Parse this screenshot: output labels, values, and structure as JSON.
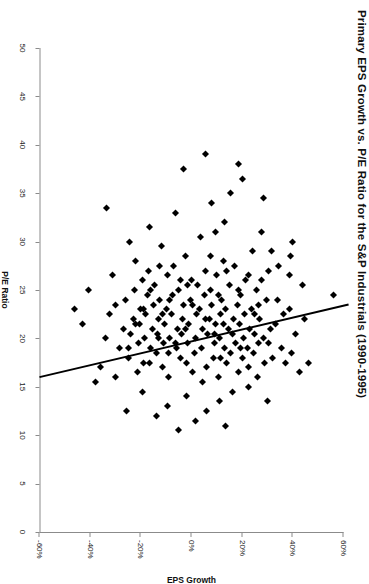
{
  "chart_data": {
    "type": "scatter",
    "title": "Primary EPS Growth vs. P/E Ratio for the S&P Industrials (1990-1995)",
    "orientation": "rotated-90-clockwise",
    "xlabel": "P/E Ratio",
    "ylabel": "EPS Growth",
    "xlim": [
      0,
      50
    ],
    "ylim": [
      -60,
      60
    ],
    "xticks": [
      0,
      5,
      10,
      15,
      20,
      25,
      30,
      35,
      40,
      45,
      50
    ],
    "xtick_labels": [
      "0",
      "5",
      "10",
      "15",
      "20",
      "25",
      "30",
      "35",
      "40",
      "45",
      "50"
    ],
    "yticks": [
      -60,
      -40,
      -20,
      0,
      20,
      40,
      60
    ],
    "ytick_labels": [
      "-60%",
      "-40%",
      "-20%",
      "0%",
      "20%",
      "40%",
      "60%"
    ],
    "grid": false,
    "legend": false,
    "marker": "diamond",
    "marker_color": "#000000",
    "axis_color": "#8b8b8b",
    "trendline": {
      "color": "#000000",
      "width": 2,
      "x_start": 16.0,
      "y_start": -60,
      "x_end": 23.5,
      "y_end": 62
    },
    "series": [
      {
        "name": "S&P Industrials",
        "points": [
          [
            24.5,
            56.0
          ],
          [
            17.5,
            46.0
          ],
          [
            16.5,
            42.5
          ],
          [
            30.0,
            40.0
          ],
          [
            28.5,
            39.0
          ],
          [
            26.5,
            38.5
          ],
          [
            22.5,
            36.5
          ],
          [
            19.0,
            35.5
          ],
          [
            21.5,
            33.0
          ],
          [
            18.0,
            32.0
          ],
          [
            27.0,
            30.5
          ],
          [
            24.0,
            29.5
          ],
          [
            17.5,
            29.0
          ],
          [
            34.5,
            28.5
          ],
          [
            31.0,
            27.5
          ],
          [
            22.0,
            27.0
          ],
          [
            19.5,
            26.5
          ],
          [
            16.0,
            26.0
          ],
          [
            25.0,
            25.5
          ],
          [
            20.5,
            25.0
          ],
          [
            18.5,
            24.5
          ],
          [
            29.0,
            24.0
          ],
          [
            23.0,
            23.5
          ],
          [
            21.0,
            23.0
          ],
          [
            17.0,
            22.5
          ],
          [
            19.0,
            22.0
          ],
          [
            26.0,
            21.5
          ],
          [
            22.5,
            21.0
          ],
          [
            20.0,
            20.5
          ],
          [
            18.0,
            20.0
          ],
          [
            24.5,
            19.5
          ],
          [
            21.5,
            19.0
          ],
          [
            16.5,
            18.5
          ],
          [
            23.5,
            18.0
          ],
          [
            19.5,
            17.5
          ],
          [
            27.5,
            17.0
          ],
          [
            22.0,
            16.5
          ],
          [
            20.5,
            16.0
          ],
          [
            18.5,
            15.5
          ],
          [
            25.5,
            15.0
          ],
          [
            21.0,
            14.5
          ],
          [
            17.5,
            14.0
          ],
          [
            23.0,
            13.5
          ],
          [
            19.0,
            13.0
          ],
          [
            28.0,
            12.5
          ],
          [
            24.0,
            12.0
          ],
          [
            22.5,
            11.5
          ],
          [
            20.0,
            11.0
          ],
          [
            16.0,
            10.5
          ],
          [
            26.5,
            10.0
          ],
          [
            21.5,
            9.5
          ],
          [
            19.5,
            9.0
          ],
          [
            18.0,
            8.5
          ],
          [
            23.5,
            8.0
          ],
          [
            25.0,
            7.5
          ],
          [
            22.0,
            7.0
          ],
          [
            20.5,
            6.5
          ],
          [
            17.0,
            6.0
          ],
          [
            27.0,
            5.5
          ],
          [
            24.5,
            5.0
          ],
          [
            21.0,
            4.5
          ],
          [
            19.0,
            4.0
          ],
          [
            30.5,
            3.5
          ],
          [
            23.0,
            3.0
          ],
          [
            25.5,
            2.5
          ],
          [
            22.5,
            2.0
          ],
          [
            20.0,
            1.5
          ],
          [
            18.5,
            1.0
          ],
          [
            16.5,
            0.5
          ],
          [
            26.0,
            0.0
          ],
          [
            24.0,
            -0.5
          ],
          [
            21.5,
            -1.0
          ],
          [
            19.5,
            -1.5
          ],
          [
            17.5,
            -2.0
          ],
          [
            28.5,
            -2.5
          ],
          [
            23.5,
            -3.0
          ],
          [
            22.0,
            -3.5
          ],
          [
            20.5,
            -4.0
          ],
          [
            18.0,
            -4.5
          ],
          [
            25.0,
            -5.0
          ],
          [
            21.0,
            -5.5
          ],
          [
            19.0,
            -6.0
          ],
          [
            33.0,
            -6.5
          ],
          [
            27.5,
            -7.0
          ],
          [
            24.5,
            -7.5
          ],
          [
            22.5,
            -8.0
          ],
          [
            20.0,
            -8.5
          ],
          [
            16.0,
            -9.0
          ],
          [
            26.5,
            -9.5
          ],
          [
            23.0,
            -10.0
          ],
          [
            21.5,
            -10.5
          ],
          [
            19.5,
            -11.0
          ],
          [
            17.0,
            -11.5
          ],
          [
            29.5,
            -12.0
          ],
          [
            24.0,
            -12.5
          ],
          [
            22.0,
            -13.0
          ],
          [
            20.5,
            -13.5
          ],
          [
            18.5,
            -14.0
          ],
          [
            25.5,
            -14.5
          ],
          [
            23.5,
            -15.0
          ],
          [
            21.0,
            -15.5
          ],
          [
            19.0,
            -16.0
          ],
          [
            31.5,
            -16.5
          ],
          [
            27.0,
            -17.0
          ],
          [
            24.5,
            -17.5
          ],
          [
            22.5,
            -18.0
          ],
          [
            20.0,
            -18.5
          ],
          [
            17.5,
            -19.0
          ],
          [
            26.0,
            -19.5
          ],
          [
            23.0,
            -20.0
          ],
          [
            21.5,
            -20.5
          ],
          [
            19.5,
            -21.0
          ],
          [
            16.5,
            -21.5
          ],
          [
            28.0,
            -22.0
          ],
          [
            25.0,
            -22.5
          ],
          [
            22.0,
            -23.0
          ],
          [
            20.5,
            -24.0
          ],
          [
            18.0,
            -25.0
          ],
          [
            24.0,
            -26.0
          ],
          [
            21.0,
            -27.0
          ],
          [
            19.0,
            -28.5
          ],
          [
            23.5,
            -30.0
          ],
          [
            26.5,
            -31.0
          ],
          [
            22.5,
            -32.5
          ],
          [
            20.0,
            -34.0
          ],
          [
            17.0,
            -36.0
          ],
          [
            15.5,
            -38.0
          ],
          [
            25.0,
            -40.5
          ],
          [
            21.5,
            -43.0
          ],
          [
            23.0,
            -46.0
          ],
          [
            33.5,
            -33.5
          ],
          [
            36.5,
            20.0
          ],
          [
            38.0,
            18.5
          ],
          [
            35.0,
            15.5
          ],
          [
            37.5,
            -3.0
          ],
          [
            34.0,
            8.0
          ],
          [
            32.0,
            13.0
          ],
          [
            39.0,
            5.5
          ],
          [
            30.0,
            -24.5
          ],
          [
            31.0,
            9.5
          ],
          [
            13.5,
            30.0
          ],
          [
            14.5,
            16.0
          ],
          [
            12.5,
            6.0
          ],
          [
            14.0,
            -2.0
          ],
          [
            13.0,
            -9.5
          ],
          [
            15.0,
            22.5
          ],
          [
            11.5,
            1.5
          ],
          [
            12.0,
            -14.0
          ],
          [
            10.5,
            -5.0
          ],
          [
            13.5,
            11.0
          ],
          [
            14.5,
            -19.5
          ],
          [
            15.5,
            4.5
          ],
          [
            11.0,
            13.5
          ],
          [
            12.5,
            -25.5
          ],
          [
            16.0,
            -30.0
          ],
          [
            29.0,
            31.5
          ],
          [
            27.5,
            34.5
          ],
          [
            25.5,
            44.0
          ],
          [
            20.5,
            41.0
          ],
          [
            18.5,
            39.5
          ],
          [
            23.5,
            26.5
          ],
          [
            21.0,
            31.0
          ],
          [
            28.5,
            7.5
          ],
          [
            26.0,
            27.5
          ],
          [
            24.0,
            34.0
          ],
          [
            22.0,
            44.5
          ],
          [
            19.5,
            30.5
          ],
          [
            17.5,
            37.0
          ],
          [
            20.0,
            28.5
          ],
          [
            23.0,
            38.5
          ],
          [
            26.5,
            22.5
          ],
          [
            25.0,
            18.5
          ],
          [
            22.5,
            25.0
          ],
          [
            21.5,
            12.5
          ],
          [
            19.0,
            19.5
          ],
          [
            18.0,
            11.5
          ],
          [
            24.5,
            10.5
          ],
          [
            27.0,
            14.0
          ],
          [
            20.5,
            9.0
          ],
          [
            22.0,
            5.5
          ],
          [
            23.5,
            0.5
          ],
          [
            25.5,
            -1.5
          ],
          [
            21.0,
            -2.5
          ],
          [
            19.5,
            -6.5
          ],
          [
            18.5,
            -9.0
          ],
          [
            26.0,
            -4.5
          ],
          [
            24.0,
            -8.5
          ],
          [
            22.5,
            -11.5
          ],
          [
            20.0,
            -13.0
          ],
          [
            17.5,
            -16.5
          ],
          [
            27.5,
            -12.5
          ],
          [
            25.0,
            -16.0
          ],
          [
            23.0,
            -19.0
          ],
          [
            21.5,
            -22.0
          ],
          [
            19.0,
            -25.0
          ]
        ]
      }
    ]
  }
}
